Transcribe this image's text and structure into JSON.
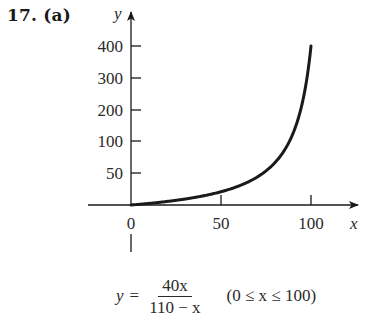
{
  "problem": {
    "label": "17. (a)"
  },
  "equation": {
    "lhs": "y",
    "equals": "=",
    "numerator": "40x",
    "denominator": "110 − x",
    "domain": "(0 ≤ x ≤ 100)"
  },
  "colors": {
    "ink": "#1a1a1a",
    "background": "#ffffff"
  },
  "chart_data": {
    "type": "line",
    "title": "17. (a)",
    "function": "y = 40x / (110 − x)",
    "domain": [
      0,
      100
    ],
    "xlabel": "x",
    "ylabel": "y",
    "x_ticks": [
      0,
      50,
      100
    ],
    "x_tick_labels": [
      "0",
      "50",
      "100"
    ],
    "y_ticks": [
      50,
      100,
      200,
      300,
      400
    ],
    "y_tick_labels": [
      "50",
      "100",
      "200",
      "300",
      "400"
    ],
    "xlim": [
      0,
      100
    ],
    "ylim": [
      0,
      400
    ],
    "grid": false,
    "legend": null,
    "series": [
      {
        "name": "y = 40x/(110 − x)",
        "x": [
          0,
          10,
          20,
          30,
          40,
          50,
          60,
          70,
          80,
          85,
          90,
          95,
          100
        ],
        "y": [
          0,
          4.0,
          8.89,
          15.0,
          22.86,
          33.33,
          48.0,
          70.0,
          106.67,
          136.0,
          180.0,
          253.33,
          400.0
        ]
      }
    ]
  }
}
